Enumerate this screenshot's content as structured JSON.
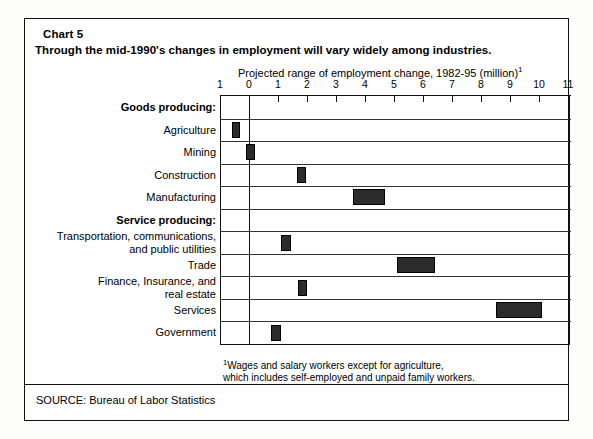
{
  "chart_number": "Chart 5",
  "headline": "Through the mid-1990's changes in employment will vary widely among industries.",
  "axis_caption": "Projected range of employment change, 1982-95 (million)",
  "axis_caption_footnote_marker": "1",
  "footnote": {
    "marker": "1",
    "line1": "Wages and salary workers except for agriculture,",
    "line2": "which includes self-employed and unpaid family workers."
  },
  "source": "SOURCE: Bureau of Labor Statistics",
  "colors": {
    "bar_fill": "#2b2b2b",
    "frame": "#111111",
    "background": "#ffffff"
  },
  "chart_data": {
    "type": "bar",
    "orientation": "horizontal",
    "subtype": "range-bar",
    "title": "Through the mid-1990's changes in employment will vary widely among industries.",
    "xlabel": "Projected range of employment change, 1982-95 (million)",
    "ylabel": "",
    "xlim": [
      -1,
      11
    ],
    "xticks": [
      -1,
      0,
      1,
      2,
      3,
      4,
      5,
      6,
      7,
      8,
      9,
      10,
      11
    ],
    "xticklabels": [
      "1",
      "0",
      "1",
      "2",
      "3",
      "4",
      "5",
      "6",
      "7",
      "8",
      "9",
      "10",
      "11"
    ],
    "grid": false,
    "legend": "none",
    "zero_reference_line": 0,
    "units": "million jobs",
    "groups": [
      {
        "label": "Goods producing:",
        "categories": [
          {
            "label": "Agriculture",
            "low": -0.6,
            "high": -0.3
          },
          {
            "label": "Mining",
            "low": -0.1,
            "high": 0.2
          },
          {
            "label": "Construction",
            "low": 1.65,
            "high": 1.95
          },
          {
            "label": "Manufacturing",
            "low": 3.6,
            "high": 4.7
          }
        ]
      },
      {
        "label": "Service producing:",
        "categories": [
          {
            "label": "Transportation, communications, and public utilities",
            "low": 1.1,
            "high": 1.45
          },
          {
            "label": "Trade",
            "low": 5.1,
            "high": 6.4
          },
          {
            "label": "Finance, Insurance, and real estate",
            "low": 1.7,
            "high": 2.0
          },
          {
            "label": "Services",
            "low": 8.5,
            "high": 10.1
          },
          {
            "label": "Government",
            "low": 0.75,
            "high": 1.1
          }
        ]
      }
    ],
    "rows": [
      {
        "label": "Goods producing:",
        "kind": "group",
        "low": null,
        "high": null
      },
      {
        "label": "Agriculture",
        "kind": "bar",
        "low": -0.6,
        "high": -0.3
      },
      {
        "label": "Mining",
        "kind": "bar",
        "low": -0.1,
        "high": 0.2
      },
      {
        "label": "Construction",
        "kind": "bar",
        "low": 1.65,
        "high": 1.95
      },
      {
        "label": "Manufacturing",
        "kind": "bar",
        "low": 3.6,
        "high": 4.7
      },
      {
        "label": "Service producing:",
        "kind": "group",
        "low": null,
        "high": null
      },
      {
        "label": "Transportation, communications,|and public utilities",
        "kind": "bar",
        "low": 1.1,
        "high": 1.45
      },
      {
        "label": "Trade",
        "kind": "bar",
        "low": 5.1,
        "high": 6.4
      },
      {
        "label": "Finance, Insurance, and|real estate",
        "kind": "bar",
        "low": 1.7,
        "high": 2.0
      },
      {
        "label": "Services",
        "kind": "bar",
        "low": 8.5,
        "high": 10.1
      },
      {
        "label": "Government",
        "kind": "bar",
        "low": 0.75,
        "high": 1.1
      }
    ]
  }
}
